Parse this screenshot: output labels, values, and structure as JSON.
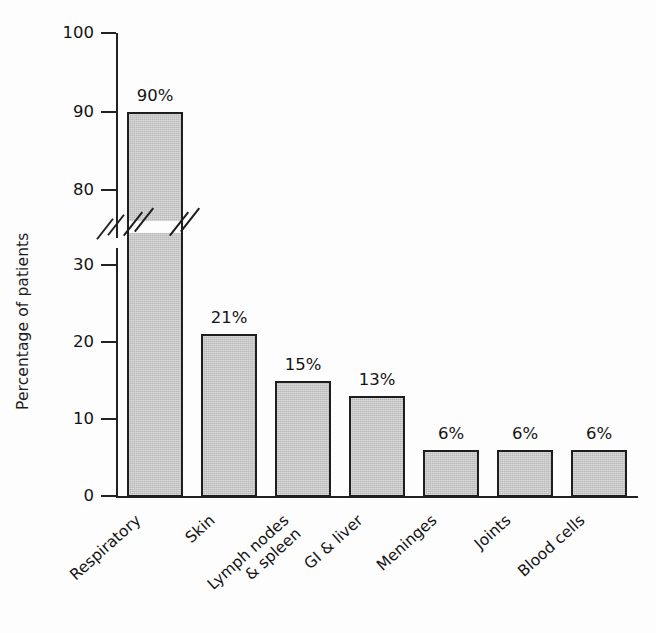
{
  "chart_data": {
    "type": "bar",
    "title": "",
    "xlabel": "",
    "ylabel": "Percentage of patients",
    "categories": [
      "Respiratory",
      "Skin",
      "Lymph nodes & spleen",
      "GI & liver",
      "Meninges",
      "Joints",
      "Blood cells"
    ],
    "category_lines": [
      [
        "Respiratory"
      ],
      [
        "Skin"
      ],
      [
        "Lymph nodes",
        "& spleen"
      ],
      [
        "GI & liver"
      ],
      [
        "Meninges"
      ],
      [
        "Joints"
      ],
      [
        "Blood cells"
      ]
    ],
    "values": [
      90,
      21,
      15,
      13,
      6,
      6,
      6
    ],
    "data_labels": [
      "90%",
      "21%",
      "15%",
      "13%",
      "6%",
      "6%",
      "6%"
    ],
    "ylim": [
      0,
      100
    ],
    "yticks": [
      0,
      10,
      20,
      30,
      80,
      90,
      100
    ],
    "ytick_labels": [
      "0",
      "10",
      "20",
      "30",
      "80",
      "90",
      "100"
    ],
    "axis_break": {
      "present": true,
      "between": [
        30,
        80
      ],
      "style": "double-diagonal-slash",
      "on_axis": true,
      "on_bars": [
        "Respiratory"
      ]
    },
    "grid": false,
    "legend": null,
    "bar_fill_color": "#b9b9b9",
    "bar_edge_color": "#1e1e1e",
    "background_color": "#fdfdfd",
    "text_color": "#141414"
  }
}
